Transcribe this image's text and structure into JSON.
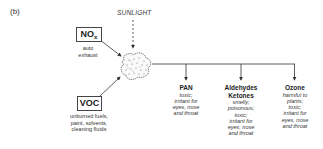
{
  "panel_label": "(b)",
  "sunlight": {
    "label": "SUNLIGHT"
  },
  "sources": [
    {
      "name": "NO",
      "subscript": "x",
      "description": [
        "auto",
        "exhaust"
      ]
    },
    {
      "name": "VOC",
      "description": [
        "unburned fuels,",
        "paint, solvents,",
        "cleaning fluids"
      ]
    }
  ],
  "products": [
    {
      "title": [
        "PAN"
      ],
      "description": [
        "toxic;",
        "irritant for",
        "eyes, nose",
        "and throat"
      ]
    },
    {
      "title": [
        "Aldehydes",
        "Ketones"
      ],
      "description": [
        "smelly;",
        "poisonous;",
        "toxic;",
        "irritant for",
        "eyes, nose",
        "and throat"
      ]
    },
    {
      "title": [
        "Ozone"
      ],
      "description": [
        "harmful to",
        "plants;",
        "toxic;",
        "irritant for",
        "eyes, nose",
        "and throat"
      ]
    }
  ],
  "colors": {
    "line": "#333333",
    "background": "#ffffff"
  }
}
